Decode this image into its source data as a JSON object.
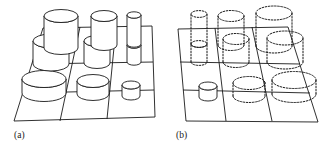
{
  "figure": {
    "type": "technical-illustration",
    "background_color": "#ffffff",
    "stroke_color": "#1a1a1a",
    "panel_count": 2
  },
  "panels": [
    {
      "id": "a",
      "label": "(a)",
      "label_x": 14,
      "label_y": 138,
      "line_style": "solid",
      "grid": {
        "rows": 3,
        "cols": 3,
        "corners": {
          "near_left": [
            14,
            121
          ],
          "near_right": [
            155,
            117
          ],
          "far_right": [
            152,
            26
          ],
          "far_left": [
            43,
            28
          ]
        }
      },
      "cylinders": [
        {
          "cell": "r0c0",
          "cx": 61,
          "cy": 24,
          "rx": 17,
          "ry": 6.5,
          "height": 38,
          "style": "solid"
        },
        {
          "cell": "r0c1",
          "cx": 104,
          "cy": 25,
          "rx": 13,
          "ry": 5.5,
          "height": 33,
          "style": "solid"
        },
        {
          "cell": "r0c2",
          "cx": 134,
          "cy": 24,
          "rx": 7,
          "ry": 3.2,
          "height": 30,
          "style": "solid"
        },
        {
          "cell": "r1c0",
          "cx": 51,
          "cy": 52,
          "rx": 18,
          "ry": 7,
          "height": 23,
          "style": "solid"
        },
        {
          "cell": "r1c1",
          "cx": 97,
          "cy": 52,
          "rx": 13,
          "ry": 5.5,
          "height": 22,
          "style": "solid"
        },
        {
          "cell": "r1c2",
          "cx": 134,
          "cy": 51,
          "rx": 7,
          "ry": 3.2,
          "height": 17,
          "style": "solid"
        },
        {
          "cell": "r2c0",
          "cx": 44,
          "cy": 93,
          "rx": 22,
          "ry": 8.5,
          "height": 14,
          "style": "solid"
        },
        {
          "cell": "r2c1",
          "cx": 93,
          "cy": 94,
          "rx": 16,
          "ry": 6.5,
          "height": 13,
          "style": "solid"
        },
        {
          "cell": "r2c2",
          "cx": 131,
          "cy": 96,
          "rx": 9,
          "ry": 4,
          "height": 11,
          "style": "solid"
        }
      ]
    },
    {
      "id": "b",
      "label": "(b)",
      "label_x": 176,
      "label_y": 138,
      "line_style": "dashed",
      "grid": {
        "rows": 3,
        "cols": 3,
        "corners": {
          "near_left": [
            186,
            121
          ],
          "near_right": [
            318,
            122
          ],
          "far_right": [
            288,
            27
          ],
          "far_left": [
            178,
            29
          ]
        }
      },
      "cylinders": [
        {
          "cell": "r0c0",
          "cx": 199,
          "cy": 24,
          "rx": 8,
          "ry": 3.4,
          "height": 31,
          "style": "dashed"
        },
        {
          "cell": "r0c1",
          "cx": 231,
          "cy": 22,
          "rx": 13,
          "ry": 5.5,
          "height": 34,
          "style": "dashed"
        },
        {
          "cell": "r0c2",
          "cx": 274,
          "cy": 21,
          "rx": 18,
          "ry": 7,
          "height": 38,
          "style": "dashed"
        },
        {
          "cell": "r1c0",
          "cx": 199,
          "cy": 52,
          "rx": 8,
          "ry": 3.4,
          "height": 18,
          "style": "dashed"
        },
        {
          "cell": "r1c1",
          "cx": 236,
          "cy": 50,
          "rx": 13,
          "ry": 5.5,
          "height": 23,
          "style": "dashed"
        },
        {
          "cell": "r1c2",
          "cx": 285,
          "cy": 49,
          "rx": 18,
          "ry": 7,
          "height": 24,
          "style": "dashed"
        },
        {
          "cell": "r2c0",
          "cx": 208,
          "cy": 97,
          "rx": 9,
          "ry": 4,
          "height": 11,
          "style": "solid"
        },
        {
          "cell": "r2c1",
          "cx": 249,
          "cy": 96,
          "rx": 16,
          "ry": 6.5,
          "height": 13,
          "style": "dashed"
        },
        {
          "cell": "r2c2",
          "cx": 294,
          "cy": 94,
          "rx": 22,
          "ry": 8.5,
          "height": 14,
          "style": "dashed"
        }
      ]
    }
  ]
}
